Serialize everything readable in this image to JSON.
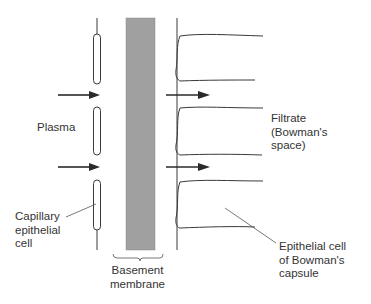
{
  "diagram": {
    "type": "glomerular filtration barrier cross-section",
    "colors": {
      "membrane": "#a0a0a0",
      "line": "#3a3a3a",
      "text": "#333333"
    },
    "labels": {
      "plasma": "Plasma",
      "filtrate": "Filtrate\n(Bowman's\nspace)",
      "capillary_cell": "Capillary\nepithelial\ncell",
      "basement_membrane": "Basement\nmembrane",
      "bowman_cell": "Epithelial cell\nof Bowman's\ncapsule"
    },
    "arrows": [
      {
        "from": "plasma",
        "to": "membrane",
        "y": 95
      },
      {
        "from": "plasma",
        "to": "membrane",
        "y": 167
      },
      {
        "from": "membrane",
        "to": "filtrate",
        "y": 95
      },
      {
        "from": "membrane",
        "to": "filtrate",
        "y": 167
      }
    ]
  }
}
